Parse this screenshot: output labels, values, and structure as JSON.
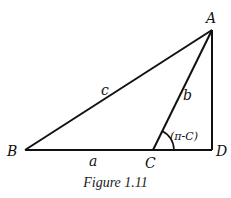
{
  "diagram": {
    "caption": "Figure 1.11",
    "vertices": {
      "A": {
        "label": "A",
        "x": 212,
        "y": 30
      },
      "B": {
        "label": "B",
        "x": 25,
        "y": 150
      },
      "C": {
        "label": "C",
        "x": 153,
        "y": 150
      },
      "D": {
        "label": "D",
        "x": 212,
        "y": 150
      }
    },
    "sides": {
      "a": "a",
      "b": "b",
      "c": "c"
    },
    "angle_label": "(π-C)",
    "line_color": "#111111"
  }
}
